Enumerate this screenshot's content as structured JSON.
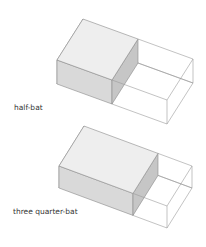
{
  "figures": [
    {
      "label": "half-bat",
      "label_pos": {
        "x": 14,
        "y": 103
      },
      "origin": {
        "x": 57,
        "y": 60
      },
      "brick_length_vec": [
        110,
        40
      ],
      "depth_vec": [
        26,
        -41
      ],
      "height": 24,
      "fraction": 0.5
    },
    {
      "label": "three quarter-bat",
      "label_pos": {
        "x": 13,
        "y": 207
      },
      "origin": {
        "x": 59,
        "y": 166
      },
      "brick_length_vec": [
        108,
        40
      ],
      "depth_vec": [
        25,
        -40
      ],
      "height": 22,
      "fraction": 0.685
    }
  ],
  "colors": {
    "line": "#8a8a8a",
    "outline_line": "#9a9a9a",
    "top_face": "#eeeeee",
    "front_face": "#d9d9d9",
    "end_face": "#c6c6c6",
    "left_face": "#e4e4e4",
    "label": "#333333"
  }
}
